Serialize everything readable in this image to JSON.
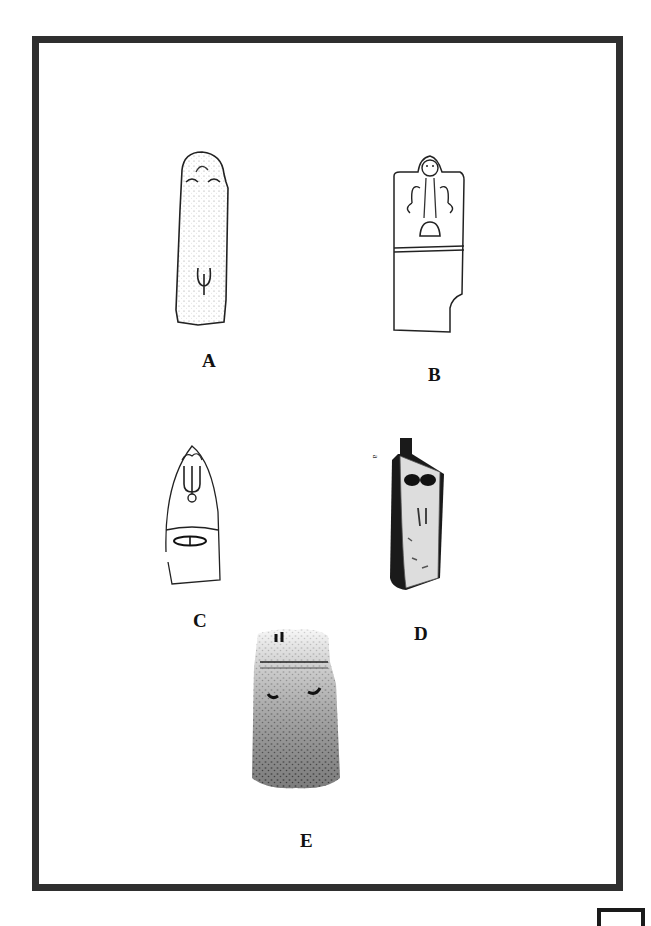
{
  "plate": {
    "figures": [
      {
        "id": "A",
        "label": "A",
        "description": "Tall narrow stela, stippled surface, carved face features at top and pendant/anchor motif lower"
      },
      {
        "id": "B",
        "label": "B",
        "description": "Stela with framed anthropomorphic figure with raised arms and U-shaped motif, horizontal band, notched lower right"
      },
      {
        "id": "C",
        "label": "C",
        "description": "Pointed-top line-drawn stela with trident motif and eye-shaped motif below horizontal band"
      },
      {
        "id": "D",
        "label": "D",
        "description": "Photographed stela in dark shading with two dark breast-like bosses"
      },
      {
        "id": "E",
        "label": "E",
        "description": "Photographed rough stone stela with small marks at top, horizontal band and two curved marks"
      }
    ],
    "side_mark": "a"
  }
}
